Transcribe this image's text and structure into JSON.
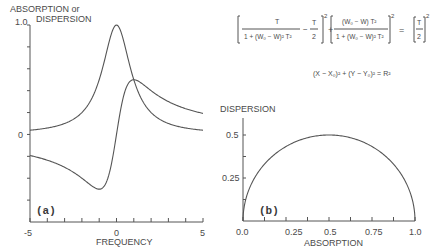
{
  "chart_data": [
    {
      "id": "a",
      "type": "line",
      "panel_label": "(a)",
      "title": "",
      "xlabel": "FREQUENCY",
      "ylabel_line1": "ABSORPTION or",
      "ylabel_line2": "DISPERSION",
      "xlim": [
        -5,
        5
      ],
      "ylim": [
        -0.8,
        1.0
      ],
      "x_tick_labels": [
        {
          "value": -5,
          "label": "-5"
        },
        {
          "value": 0,
          "label": "0"
        },
        {
          "value": 5,
          "label": "5"
        }
      ],
      "x_minor_ticks": [
        -4,
        -3,
        -2,
        -1,
        1,
        2,
        3,
        4
      ],
      "y_tick_labels": [
        {
          "value": 1.0,
          "label": "1.0"
        },
        {
          "value": 0,
          "label": "0"
        }
      ],
      "y_minor_ticks": [
        0.8,
        0.6,
        0.4,
        0.2,
        -0.2,
        -0.4,
        -0.6
      ],
      "series": [
        {
          "name": "absorption",
          "formula": "1/(1+x^2)",
          "x": [
            -5,
            -4,
            -3,
            -2,
            -1.5,
            -1,
            -0.5,
            0,
            0.5,
            1,
            1.5,
            2,
            3,
            4,
            5
          ],
          "y": [
            0.038,
            0.059,
            0.1,
            0.2,
            0.308,
            0.5,
            0.8,
            1.0,
            0.8,
            0.5,
            0.308,
            0.2,
            0.1,
            0.059,
            0.038
          ]
        },
        {
          "name": "dispersion",
          "formula": "x/(1+x^2)",
          "x": [
            -5,
            -4,
            -3,
            -2,
            -1.5,
            -1,
            -0.5,
            0,
            0.5,
            1,
            1.5,
            2,
            3,
            4,
            5
          ],
          "y": [
            -0.192,
            -0.235,
            -0.3,
            -0.4,
            -0.462,
            -0.5,
            -0.4,
            0,
            0.4,
            0.5,
            0.462,
            0.4,
            0.3,
            0.235,
            0.192
          ]
        }
      ]
    },
    {
      "id": "b",
      "type": "line",
      "panel_label": "(b)",
      "xlabel": "ABSORPTION",
      "ylabel": "DISPERSION",
      "xlim": [
        0,
        1.0
      ],
      "ylim": [
        0,
        0.5
      ],
      "x_tick_labels": [
        {
          "value": 0.0,
          "label": "0.0"
        },
        {
          "value": 0.25,
          "label": "0.25"
        },
        {
          "value": 0.5,
          "label": "0.5"
        },
        {
          "value": 0.75,
          "label": "0.75"
        },
        {
          "value": 1.0,
          "label": "1.0"
        }
      ],
      "x_minor_ticks": [
        0.125,
        0.375,
        0.625,
        0.875
      ],
      "y_tick_labels": [
        {
          "value": 0.5,
          "label": "0.5"
        },
        {
          "value": 0.25,
          "label": "0.25"
        }
      ],
      "y_minor_ticks": [
        0.125,
        0.375
      ],
      "series": [
        {
          "name": "semicircle",
          "center": [
            0.5,
            0
          ],
          "radius": 0.5
        }
      ]
    }
  ],
  "equations": {
    "eq1": {
      "frac1_num": "T",
      "frac1_den": "1 + (W₀ − W)² T²",
      "minus_term": "−",
      "half_num": "T",
      "half_den": "2",
      "sq": "2",
      "plus": "+",
      "frac2_num": "(W₀ − W) T²",
      "frac2_den": "1 + (W₀ − W)² T²",
      "equals": "=",
      "rhs_num": "T",
      "rhs_den": "2"
    },
    "eq2": "(X − X₀)² + (Y − Y₀)² = R²"
  }
}
